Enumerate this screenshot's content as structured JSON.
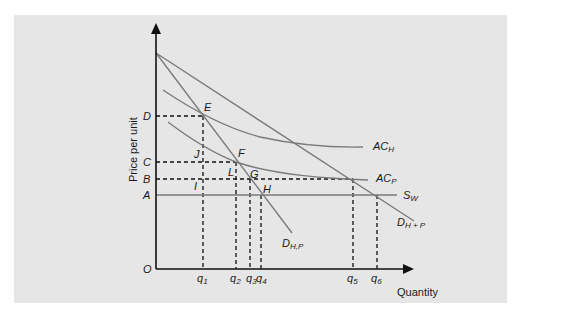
{
  "diagram": {
    "axes": {
      "x_label": "Quantity",
      "y_label": "Price per unit",
      "origin": "O"
    },
    "price_levels": [
      {
        "id": "D",
        "label": "D"
      },
      {
        "id": "C",
        "label": "C"
      },
      {
        "id": "B",
        "label": "B"
      },
      {
        "id": "A",
        "label": "A"
      }
    ],
    "quantity_levels": [
      {
        "id": "q1",
        "base": "q",
        "sub": "1"
      },
      {
        "id": "q2",
        "base": "q",
        "sub": "2"
      },
      {
        "id": "q3",
        "base": "q",
        "sub": "3"
      },
      {
        "id": "q4",
        "base": "q",
        "sub": "4"
      },
      {
        "id": "q5",
        "base": "q",
        "sub": "5"
      },
      {
        "id": "q6",
        "base": "q",
        "sub": "6"
      }
    ],
    "points": [
      {
        "id": "E",
        "label": "E"
      },
      {
        "id": "F",
        "label": "F"
      },
      {
        "id": "G",
        "label": "G"
      },
      {
        "id": "H",
        "label": "H"
      },
      {
        "id": "I",
        "label": "I"
      },
      {
        "id": "J",
        "label": "J"
      },
      {
        "id": "L",
        "label": "L"
      }
    ],
    "curves": [
      {
        "id": "AC_H",
        "base": "AC",
        "sub": "H"
      },
      {
        "id": "AC_P",
        "base": "AC",
        "sub": "P"
      },
      {
        "id": "S_W",
        "base": "S",
        "sub": "W"
      },
      {
        "id": "D_H+P",
        "base": "D",
        "sub": "H + P"
      },
      {
        "id": "D_H,P",
        "base": "D",
        "sub": "H,P"
      }
    ],
    "colors": {
      "panel": "#e6e6e6",
      "axis": "#111111",
      "curve": "#7a7a7a",
      "dashed": "#111111"
    }
  }
}
